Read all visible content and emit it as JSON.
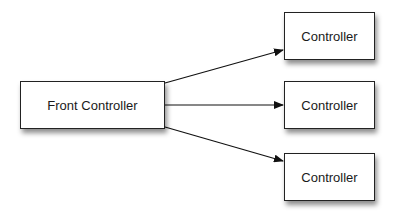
{
  "diagram": {
    "source": {
      "label": "Front Controller"
    },
    "targets": [
      {
        "label": "Controller"
      },
      {
        "label": "Controller"
      },
      {
        "label": "Controller"
      }
    ],
    "edges": [
      {
        "from": "Front Controller",
        "to": "Controller (top)"
      },
      {
        "from": "Front Controller",
        "to": "Controller (middle)"
      },
      {
        "from": "Front Controller",
        "to": "Controller (bottom)"
      }
    ]
  }
}
